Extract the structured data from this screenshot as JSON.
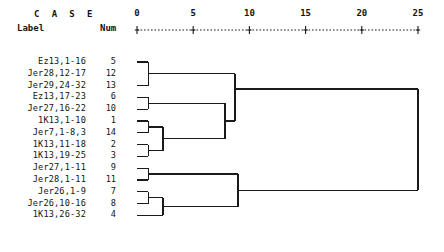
{
  "header": {
    "case_title": "C A S E",
    "label_col": "Label",
    "num_col": "Num"
  },
  "axis": {
    "ticks": [
      {
        "value": 0,
        "label": "0",
        "x": 137
      },
      {
        "value": 5,
        "label": "5",
        "x": 193.2
      },
      {
        "value": 10,
        "label": "10",
        "x": 249.4
      },
      {
        "value": 15,
        "label": "15",
        "x": 305.6
      },
      {
        "value": 20,
        "label": "20",
        "x": 361.8
      },
      {
        "value": 25,
        "label": "25",
        "x": 418
      }
    ],
    "line_color": "#1a1a1a",
    "x0": 137,
    "x_per_unit": 11.24,
    "min": 0,
    "max": 25
  },
  "chart_data": {
    "type": "dendrogram",
    "title": "C A S E",
    "xlabel": "Rescaled Distance Cluster Combine",
    "ylabel": "",
    "xlim": [
      0,
      25
    ],
    "grid": false,
    "legend": null,
    "axis_ticks": [
      0,
      5,
      10,
      15,
      20,
      25
    ],
    "leaves": [
      {
        "label": "Ez13,1-16",
        "num": "5",
        "y": 62
      },
      {
        "label": "Jer28,12-17",
        "num": "12",
        "y": 73.8
      },
      {
        "label": "Jer29,24-32",
        "num": "13",
        "y": 85.6
      },
      {
        "label": "Ez13,17-23",
        "num": "6",
        "y": 97.4
      },
      {
        "label": "Jer27,16-22",
        "num": "10",
        "y": 109.2
      },
      {
        "label": "1K13,1-10",
        "num": "1",
        "y": 121
      },
      {
        "label": "Jer7,1-8,3",
        "num": "14",
        "y": 132.8
      },
      {
        "label": "1K13,11-18",
        "num": "2",
        "y": 144.6
      },
      {
        "label": "1K13,19-25",
        "num": "3",
        "y": 156.4
      },
      {
        "label": "Jer27,1-11",
        "num": "9",
        "y": 168.2
      },
      {
        "label": "Jer28,1-11",
        "num": "11",
        "y": 180
      },
      {
        "label": "Jer26,1-9",
        "num": "7",
        "y": 191.8
      },
      {
        "label": "Jer26,10-16",
        "num": "8",
        "y": 203.6
      },
      {
        "label": "1K13,26-32",
        "num": "4",
        "y": 215.4
      }
    ],
    "merges": [
      {
        "id": "m1",
        "children": [
          "5",
          "13"
        ],
        "distance": 1.0,
        "x": 148.2,
        "y_top": 62,
        "y_bot": 85.6,
        "y": 73.8
      },
      {
        "id": "m2",
        "children": [
          "6",
          "10"
        ],
        "distance": 1.0,
        "x": 148.2,
        "y_top": 97.4,
        "y_bot": 109.2,
        "y": 103.3
      },
      {
        "id": "m3",
        "children": [
          "1",
          "14"
        ],
        "distance": 1.0,
        "x": 148.2,
        "y_top": 121,
        "y_bot": 132.8,
        "y": 126.9
      },
      {
        "id": "m4",
        "children": [
          "2",
          "3"
        ],
        "distance": 1.0,
        "x": 148.2,
        "y_top": 144.6,
        "y_bot": 156.4,
        "y": 150.5
      },
      {
        "id": "m5",
        "children": [
          "9",
          "11"
        ],
        "distance": 1.0,
        "x": 148.2,
        "y_top": 168.2,
        "y_bot": 180,
        "y": 174.1
      },
      {
        "id": "m6",
        "children": [
          "7",
          "8"
        ],
        "distance": 1.0,
        "x": 148.2,
        "y_top": 191.8,
        "y_bot": 203.6,
        "y": 197.7
      },
      {
        "id": "m7",
        "children": [
          "m3",
          "m4"
        ],
        "distance": 2.3,
        "x": 163,
        "y_top": 126.9,
        "y_bot": 150.5,
        "y": 138.7
      },
      {
        "id": "m8",
        "children": [
          "m6",
          "4"
        ],
        "distance": 2.3,
        "x": 163,
        "y_top": 197.7,
        "y_bot": 215.4,
        "y": 206.5
      },
      {
        "id": "m9",
        "children": [
          "m2",
          "m7"
        ],
        "distance": 7.8,
        "x": 225,
        "y_top": 103.3,
        "y_bot": 138.7,
        "y": 121
      },
      {
        "id": "m10",
        "children": [
          "m5",
          "m8"
        ],
        "distance": 9.0,
        "x": 238,
        "y_top": 174.1,
        "y_bot": 206.5,
        "y": 190.3
      },
      {
        "id": "m11",
        "children": [
          "m1",
          "m9"
        ],
        "distance": 8.7,
        "x": 235,
        "y_top": 73.8,
        "y_bot": 121,
        "y": 89
      },
      {
        "id": "m12",
        "children": [
          "m11",
          "m10"
        ],
        "distance": 25.0,
        "x": 418,
        "y_top": 89,
        "y_bot": 190.3,
        "y": 139.6
      }
    ]
  },
  "colors": {
    "line": "#1a1a1a",
    "text": "#141414",
    "background": "#ffffff"
  }
}
